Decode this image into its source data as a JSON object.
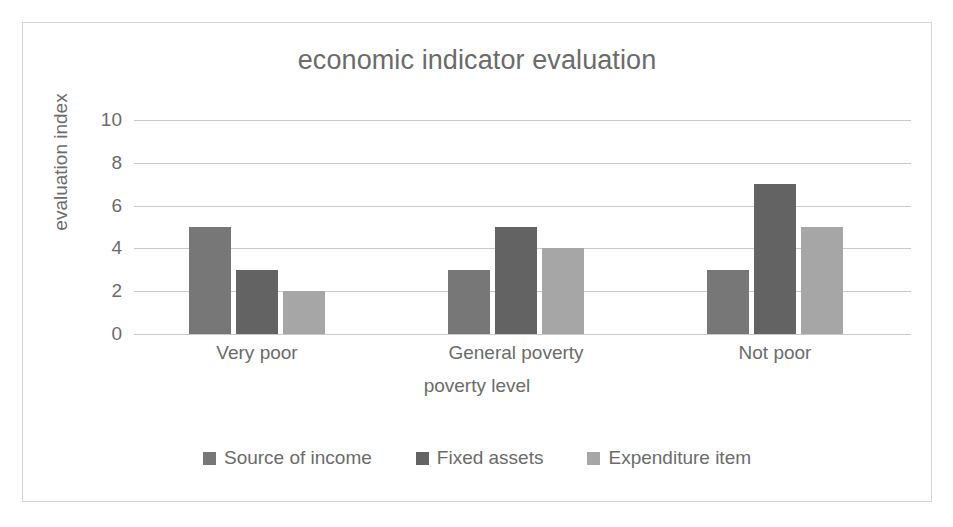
{
  "chart_data": {
    "type": "bar",
    "title": "economic indicator evaluation",
    "xlabel": "poverty level",
    "ylabel": "evaluation index",
    "categories": [
      "Very poor",
      "General poverty",
      "Not poor"
    ],
    "series": [
      {
        "name": "Source of income",
        "values": [
          5,
          3,
          3
        ],
        "color": "#777777"
      },
      {
        "name": "Fixed assets",
        "values": [
          3,
          5,
          7
        ],
        "color": "#636363"
      },
      {
        "name": "Expenditure item",
        "values": [
          2,
          4,
          5
        ],
        "color": "#a6a6a6"
      }
    ],
    "ylim": [
      0,
      10
    ],
    "yticks": [
      0,
      2,
      4,
      6,
      8,
      10
    ],
    "ytick_labels": [
      "0",
      "2",
      "4",
      "6",
      "8",
      "10"
    ],
    "grid": true,
    "legend_position": "bottom",
    "plot_background": "#ffffff",
    "gridline_color": "#c9c9c9",
    "text_color": "#6b6b6b",
    "border_color": "#d6d6d6"
  }
}
